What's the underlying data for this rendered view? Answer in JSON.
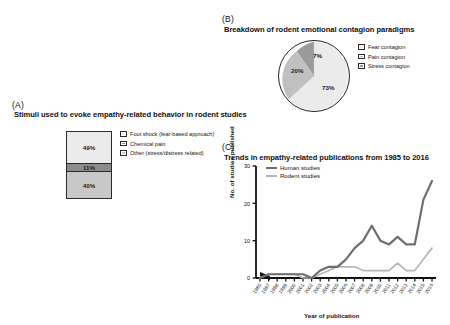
{
  "figure": {
    "panels": [
      {
        "letter": "(A)",
        "title": "Stimuli used to evoke empathy-related behavior in rodent studies"
      },
      {
        "letter": "(B)",
        "title": "Breakdown of rodent emotional contagion paradigms"
      },
      {
        "letter": "(C)",
        "title": "Trends in empathy-related publications from 1985 to 2016"
      }
    ]
  },
  "panel_a": {
    "letter": "(A)",
    "title": "Stimuli used to evoke empathy-related behavior in rodent studies",
    "legend": [
      {
        "label": "Foot shock (fear-based approach)",
        "color": "#ebebeb"
      },
      {
        "label": "Chemical pain",
        "color": "#8c8c8c"
      },
      {
        "label": "Other (stress/distress related)",
        "color": "#c8c8c8"
      }
    ],
    "segments": [
      {
        "label": "49%",
        "value": 49,
        "color": "#ebebeb"
      },
      {
        "label": "11%",
        "value": 11,
        "color": "#8c8c8c"
      },
      {
        "label": "40%",
        "value": 40,
        "color": "#c8c8c8"
      }
    ]
  },
  "panel_b": {
    "letter": "(B)",
    "title": "Breakdown of rodent emotional contagion paradigms",
    "legend": [
      {
        "label": "Fear contagion",
        "color": "#ebebeb"
      },
      {
        "label": "Pain contagion",
        "color": "#c0c0c0"
      },
      {
        "label": "Stress contagion",
        "color": "#9a9a9a"
      }
    ],
    "slices": [
      {
        "label": "73%",
        "value": 73,
        "color": "#ebebeb"
      },
      {
        "label": "20%",
        "value": 20,
        "color": "#c0c0c0"
      },
      {
        "label": "7%",
        "value": 7,
        "color": "#9a9a9a"
      }
    ]
  },
  "panel_c": {
    "letter": "(C)",
    "title": "Trends in empathy-related publications from 1985 to 2016",
    "ylabel": "No. of studies published",
    "xlabel": "Year of publication",
    "legend": [
      {
        "label": "Human studies",
        "color": "#6e6e6e"
      },
      {
        "label": "Rodent studies",
        "color": "#b5b5b5"
      }
    ],
    "yticks": [
      "0",
      "10",
      "20",
      "30"
    ],
    "axis_break": true
  },
  "chart_data": [
    {
      "type": "bar",
      "title": "Stimuli used to evoke empathy-related behavior in rodent studies",
      "categories": [
        "Foot shock (fear-based approach)",
        "Chemical pain",
        "Other (stress/distress related)"
      ],
      "values": [
        49,
        11,
        40
      ],
      "unit": "%",
      "stacked": true,
      "xlabel": "",
      "ylabel": "",
      "legend_position": "right",
      "grid": false
    },
    {
      "type": "pie",
      "title": "Breakdown of rodent emotional contagion paradigms",
      "categories": [
        "Fear contagion",
        "Pain contagion",
        "Stress contagion"
      ],
      "values": [
        73,
        20,
        7
      ],
      "unit": "%",
      "legend_position": "right",
      "grid": false
    },
    {
      "type": "line",
      "title": "Trends in empathy-related publications from 1985 to 2016",
      "xlabel": "Year of publication",
      "ylabel": "No. of studies published",
      "ylim": [
        0,
        30
      ],
      "yticks": [
        0,
        10,
        20,
        30
      ],
      "grid": false,
      "legend_position": "top-left",
      "axis_break_after_first_category": true,
      "categories": [
        "1985",
        "1997",
        "1998",
        "1999",
        "2000",
        "2001",
        "2002",
        "2003",
        "2004",
        "2005",
        "2006",
        "2007",
        "2008",
        "2009",
        "2010",
        "2011",
        "2012",
        "2013",
        "2014",
        "2015",
        "2016"
      ],
      "series": [
        {
          "name": "Human studies",
          "color": "#6e6e6e",
          "values": [
            0,
            1,
            1,
            1,
            1,
            1,
            0,
            2,
            3,
            3,
            5,
            8,
            10,
            14,
            10,
            9,
            11,
            9,
            9,
            21,
            26,
            26
          ]
        },
        {
          "name": "Rodent studies",
          "color": "#b5b5b5",
          "values": [
            0,
            1,
            1,
            1,
            1,
            0,
            0,
            1,
            2,
            3,
            3,
            3,
            2,
            2,
            2,
            2,
            4,
            2,
            2,
            5,
            8,
            6
          ]
        }
      ]
    }
  ]
}
